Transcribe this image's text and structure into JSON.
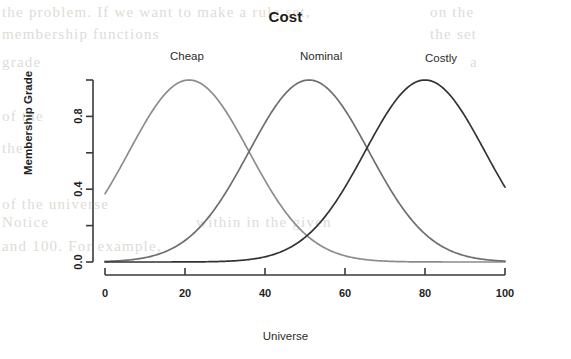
{
  "figure": {
    "title": "Cost",
    "xlabel": "Universe",
    "ylabel": "Membership Grade"
  },
  "curve_labels": {
    "cheap": "Cheap",
    "nominal": "Nominal",
    "costly": "Costly"
  },
  "axes": {
    "x_ticks": [
      "0",
      "20",
      "40",
      "60",
      "80",
      "100"
    ],
    "y_ticks": [
      "0.0",
      "0.4",
      "0.8"
    ]
  },
  "colors": {
    "cheap": "#8c8c8c",
    "nominal": "#6e6e6e",
    "costly": "#333333",
    "axis": "#3a3a3a",
    "background": "#ffffff"
  },
  "chart_data": {
    "type": "line",
    "title": "Cost",
    "xlabel": "Universe",
    "ylabel": "Membership Grade",
    "xlim": [
      0,
      100
    ],
    "ylim": [
      0,
      1
    ],
    "x_ticks": [
      0,
      20,
      40,
      60,
      80,
      100
    ],
    "y_ticks": [
      0.0,
      0.4,
      0.8
    ],
    "y_minor_ticks": [
      0.2,
      0.6,
      1.0
    ],
    "grid": false,
    "legend": "inline-labels-above-peaks",
    "annotations": [
      {
        "text": "Cheap",
        "x": 21,
        "y": 1.05
      },
      {
        "text": "Nominal",
        "x": 51,
        "y": 1.05
      },
      {
        "text": "Costly",
        "x": 80,
        "y": 1.05
      }
    ],
    "x": [
      0,
      5,
      10,
      15,
      20,
      25,
      30,
      35,
      40,
      45,
      50,
      55,
      60,
      65,
      70,
      75,
      80,
      85,
      90,
      95,
      100
    ],
    "series": [
      {
        "name": "Cheap",
        "color": "#8c8c8c",
        "mean": 21,
        "sigma": 15,
        "values": [
          0.42,
          0.64,
          0.83,
          0.96,
          1.0,
          0.95,
          0.82,
          0.65,
          0.46,
          0.3,
          0.17,
          0.09,
          0.04,
          0.015,
          0.005,
          0.002,
          0.0005,
          0.0001,
          0.0,
          0.0,
          0.0
        ]
      },
      {
        "name": "Nominal",
        "color": "#6e6e6e",
        "mean": 51,
        "sigma": 15,
        "values": [
          0.0,
          0.002,
          0.006,
          0.018,
          0.046,
          0.105,
          0.21,
          0.37,
          0.58,
          0.8,
          0.98,
          1.0,
          0.91,
          0.73,
          0.52,
          0.33,
          0.18,
          0.09,
          0.04,
          0.013,
          0.004
        ]
      },
      {
        "name": "Costly",
        "color": "#333333",
        "mean": 80,
        "sigma": 15,
        "values": [
          0.0,
          0.0,
          0.0,
          0.0002,
          0.0008,
          0.003,
          0.009,
          0.024,
          0.056,
          0.115,
          0.21,
          0.34,
          0.5,
          0.68,
          0.84,
          0.96,
          1.0,
          0.95,
          0.82,
          0.64,
          0.42
        ]
      }
    ]
  },
  "scan_bleed": [
    {
      "text": "the problem. If we want to make a rule set,",
      "left": 2,
      "top": 4
    },
    {
      "text": "on the",
      "left": 430,
      "top": 4
    },
    {
      "text": "membership functions",
      "left": 2,
      "top": 26
    },
    {
      "text": "the set",
      "left": 430,
      "top": 26
    },
    {
      "text": "grade",
      "left": 2,
      "top": 54
    },
    {
      "text": "a",
      "left": 470,
      "top": 54
    },
    {
      "text": "of the",
      "left": 2,
      "top": 108
    },
    {
      "text": "the",
      "left": 2,
      "top": 140
    },
    {
      "text": "of the universe",
      "left": 2,
      "top": 196
    },
    {
      "text": "Notice",
      "left": 2,
      "top": 214
    },
    {
      "text": "within in the given",
      "left": 196,
      "top": 214
    },
    {
      "text": "and 100. For example,",
      "left": 2,
      "top": 238
    }
  ]
}
